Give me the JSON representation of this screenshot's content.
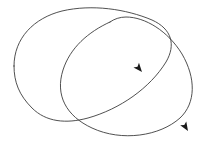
{
  "figure": {
    "background_color": "#ffffff",
    "stroke_color": "#3c3c3c",
    "arrow_color": "#1a1a1a",
    "stroke_width": 0.9,
    "width": 201,
    "height": 142,
    "loop_count": 2,
    "arrow_count": 2,
    "intersection_count": 2
  },
  "shapes": {
    "loop_a": {
      "name": "left-upper-loop",
      "description": "rounded quadrilateral loop occupying the upper-left region",
      "path": "M 14 66 C 14 38 34 18 62 11 C 92 4 126 9 152 20 C 172 29 176 45 166 62 C 150 88 120 109 88 118 C 66 124 46 122 32 108 C 19 95 14 82 14 66 Z",
      "bbox": [
        14,
        8,
        162,
        116
      ],
      "closed": true
    },
    "loop_b": {
      "name": "right-lower-ellipse-loop",
      "description": "tilted elliptical loop extending from upper-left-center to lower-right",
      "path": "M 110 22 C 88 32 70 48 63 70 C 55 95 66 116 92 128 C 122 142 160 136 180 118 C 196 103 196 78 182 54 C 168 31 145 17 126 17 C 120 17 114 19 110 22 Z",
      "bbox": [
        55,
        17,
        139,
        119
      ],
      "closed": true
    }
  },
  "arrows": {
    "arrow_1": {
      "name": "arrow-on-loop-b-upper",
      "tip": [
        142,
        72
      ],
      "angle_deg": 50,
      "direction": "down-right",
      "on_shape": "loop_b"
    },
    "arrow_2": {
      "name": "arrow-on-loop-a-lower",
      "tip": [
        188,
        131
      ],
      "angle_deg": 58,
      "direction": "down-right",
      "on_shape": "loop_b"
    }
  },
  "intersections": {
    "point_1": [
      143,
      24
    ],
    "point_2": [
      88,
      111
    ]
  }
}
